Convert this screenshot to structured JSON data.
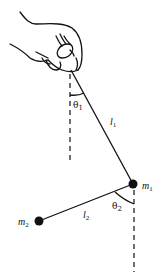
{
  "diagram": {
    "labels": {
      "theta1": {
        "base": "θ",
        "sub": "1"
      },
      "theta2": {
        "base": "θ",
        "sub": "2"
      },
      "l1": {
        "base": "l",
        "sub": "1"
      },
      "l2": {
        "base": "l",
        "sub": "2"
      },
      "m1": {
        "base": "m",
        "sub": "1"
      },
      "m2": {
        "base": "m",
        "sub": "2"
      }
    },
    "colors": {
      "line": "#111111",
      "background": "#ffffff"
    }
  }
}
